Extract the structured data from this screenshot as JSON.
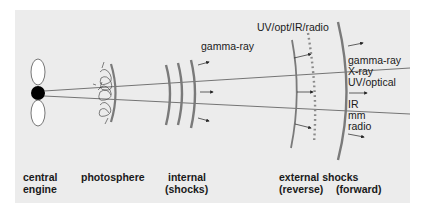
{
  "diagram": {
    "colors": {
      "background": "#ececec",
      "shock": "#7a7a7a",
      "line": "#555555",
      "engine": "#000000",
      "text": "#1a1a1a"
    },
    "emission_labels": {
      "internal": "gamma-ray",
      "reverse": "UV/opt/IR/radio",
      "forward_high": [
        "gamma-ray",
        "X-ray",
        "UV/optical"
      ],
      "forward_low": [
        "IR",
        "mm",
        "radio"
      ]
    },
    "region_labels": {
      "central_engine": [
        "central",
        "engine"
      ],
      "photosphere": "photosphere",
      "internal": [
        "internal",
        "(shocks)"
      ],
      "external": "external shocks",
      "reverse": "(reverse)",
      "forward": "(forward)"
    }
  }
}
